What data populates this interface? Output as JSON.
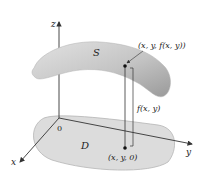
{
  "figure": {
    "axes": {
      "z_label": "z",
      "y_label": "y",
      "x_label": "x",
      "origin_label": "0"
    },
    "surface_label": "S",
    "domain_label": "D",
    "surface_point_label": "(x, y, f(x, y))",
    "domain_point_label": "(x, y, 0)",
    "height_label": "f(x, y)"
  },
  "colors": {
    "surface_fill": "#c8c8c8",
    "surface_shade": "#a9a9a9",
    "domain_fill": "#dedede",
    "line": "#333333"
  }
}
